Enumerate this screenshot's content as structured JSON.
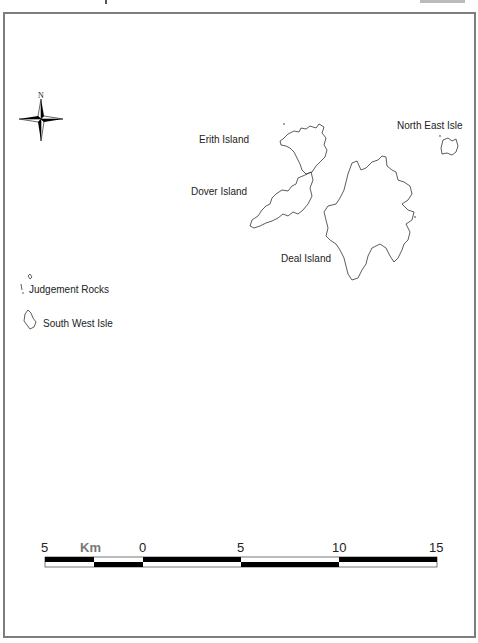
{
  "map": {
    "frame": {
      "border_color": "#7d7d7d"
    },
    "north_arrow": {
      "label": "N"
    },
    "islands": [
      {
        "name": "Erith Island",
        "label": "Erith Island"
      },
      {
        "name": "Dover Island",
        "label": "Dover Island"
      },
      {
        "name": "Deal Island",
        "label": "Deal Island"
      },
      {
        "name": "North East Isle",
        "label": "North East Isle"
      },
      {
        "name": "Judgement Rocks",
        "label": "Judgement Rocks"
      },
      {
        "name": "South West Isle",
        "label": "South West Isle"
      }
    ],
    "scale_bar": {
      "unit": "Km",
      "ticks": [
        "5",
        "0",
        "5",
        "10",
        "15"
      ]
    }
  }
}
